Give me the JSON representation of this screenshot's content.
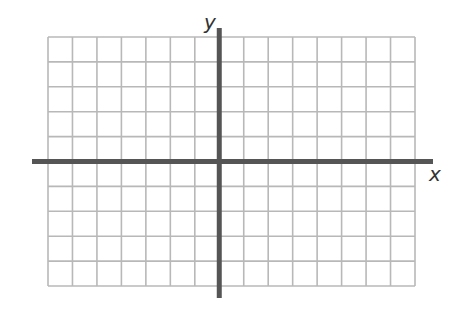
{
  "diagram": {
    "type": "coordinate-plane",
    "x_axis_label": "x",
    "y_axis_label": "y",
    "grid": {
      "columns_left_of_y_axis": 7,
      "columns_right_of_y_axis": 8,
      "rows_above_x_axis": 5,
      "rows_below_x_axis": 5
    },
    "colors": {
      "grid": "#b8b8b8",
      "axis": "#555555",
      "label": "#333333"
    }
  }
}
